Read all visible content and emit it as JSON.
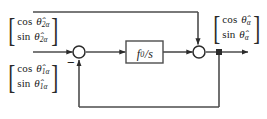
{
  "diagram": {
    "canvas": {
      "width": 267,
      "height": 119,
      "background": "#ffffff"
    },
    "line_color": "#4d4d4d",
    "stroke_color": "#2b2b2b",
    "blocks": [
      {
        "id": "input-vector-2",
        "role": "input-signal-vector",
        "rows": [
          {
            "fn": "cos",
            "symbol": "θ̂",
            "subscript": "2α"
          },
          {
            "fn": "sin",
            "symbol": "θ̂",
            "subscript": "2α"
          }
        ]
      },
      {
        "id": "input-vector-1",
        "role": "input-signal-vector",
        "rows": [
          {
            "fn": "cos",
            "symbol": "θ̂",
            "subscript": "1α"
          },
          {
            "fn": "sin",
            "symbol": "θ̂",
            "subscript": "1α"
          }
        ]
      },
      {
        "id": "output-vector",
        "role": "output-signal-vector",
        "rows": [
          {
            "fn": "cos",
            "symbol": "θ̂",
            "subscript": "α"
          },
          {
            "fn": "sin",
            "symbol": "θ̂",
            "subscript": "α"
          }
        ]
      }
    ],
    "transfer_function": {
      "id": "integrator-block",
      "numerator": "f",
      "numerator_subscript": "0",
      "divider": "/",
      "denominator": "s",
      "label": "f0 / s"
    },
    "summing_junctions": [
      {
        "id": "summing-junction-left",
        "sign": "−",
        "cx": 79,
        "cy": 52
      },
      {
        "id": "summing-junction-right",
        "sign": "",
        "cx": 199,
        "cy": 52
      }
    ],
    "node": {
      "id": "takeoff-node",
      "cx": 219,
      "cy": 52
    }
  }
}
